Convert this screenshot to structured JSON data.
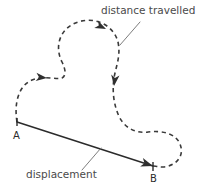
{
  "figure": {
    "background_color": "#ffffff",
    "width": 199,
    "height": 188
  },
  "labels": {
    "distance_travelled": "distance travelled",
    "displacement": "displacement",
    "point_a": "A",
    "point_b": "B"
  },
  "colors": {
    "path_stroke": "#3a3a3a",
    "vector_stroke": "#2b2b2b",
    "leader_stroke": "#6e6e6e",
    "label_text": "#4a4a4a",
    "point_text": "#2b2b2b",
    "arrow_fill": "#2f2f2f"
  },
  "geometry": {
    "point_a": {
      "x": 17,
      "y": 122
    },
    "point_b": {
      "x": 153,
      "y": 166
    },
    "travel_path_d": "M 17,122 C 14,104 18,86 32,80 C 44,75 55,80 62,78 C 66,76 66,70 62,62 C 54,46 60,28 78,22 C 96,16 114,26 118,42 C 121,56 116,66 114,78 C 112,92 114,104 118,114 C 123,127 135,134 148,132 C 163,130 176,134 180,144 C 185,156 176,166 163,167 C 158,167 155,166 153,166",
    "displacement_d": "M 17,122 L 153,166",
    "leader_distance_d": "M 140,22 L 120,45",
    "leader_displacement_d": "M 82,170 L 101,148",
    "arrowheads": [
      {
        "name": "arrow-left-loop",
        "x": 44,
        "y": 78,
        "angle": 8
      },
      {
        "name": "arrow-top-loop",
        "x": 103,
        "y": 28,
        "angle": 28
      },
      {
        "name": "arrow-right-descent",
        "x": 113,
        "y": 83,
        "angle": 96
      },
      {
        "name": "arrow-displacement-tip",
        "x": 153,
        "y": 166,
        "angle": 18
      }
    ],
    "label_positions": {
      "distance_travelled": {
        "x": 101,
        "y": 14
      },
      "displacement": {
        "x": 26,
        "y": 178
      },
      "point_a": {
        "x": 13,
        "y": 139
      },
      "point_b": {
        "x": 152,
        "y": 182
      }
    }
  },
  "icons": {
    "arrowhead": "arrow-head-icon",
    "dashed_curve": "dashed-path-icon",
    "vector_line": "vector-line-icon"
  }
}
